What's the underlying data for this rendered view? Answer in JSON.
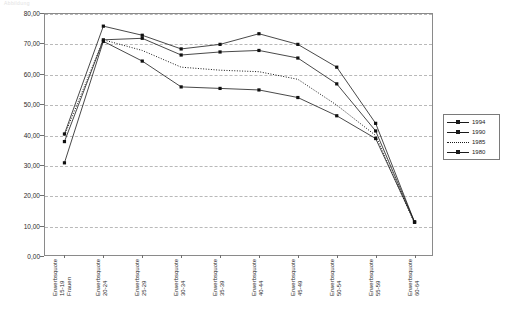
{
  "faint_header": "Abbildung",
  "chart_data": {
    "type": "line",
    "title": "",
    "subtitle": "",
    "xlabel": "",
    "ylabel": "",
    "ylim": [
      0,
      80
    ],
    "ytick_step": 10,
    "grid": true,
    "legend_position": "right",
    "ytick_labels": [
      "0,00",
      "10,00",
      "20,00",
      "30,00",
      "40,00",
      "50,00",
      "60,00",
      "70,00",
      "80,00"
    ],
    "categories": [
      "Erwerbsquote 15-19 Frauen",
      "Erwerbsquote 20-24",
      "Erwerbsquote 25-29",
      "Erwerbsquote 30-34",
      "Erwerbsquote 35-39",
      "Erwerbsquote 40-44",
      "Erwerbsquote 45-49",
      "Erwerbsquote 50-54",
      "Erwerbsquote 55-59",
      "Erwerbsquote 60-64"
    ],
    "category_lines": [
      [
        "Erwerbsquote",
        "15-19",
        "Frauen"
      ],
      [
        "Erwerbsquote",
        "20-24"
      ],
      [
        "Erwerbsquote",
        "25-29"
      ],
      [
        "Erwerbsquote",
        "30-34"
      ],
      [
        "Erwerbsquote",
        "35-39"
      ],
      [
        "Erwerbsquote",
        "40-44"
      ],
      [
        "Erwerbsquote",
        "45-49"
      ],
      [
        "Erwerbsquote",
        "50-54"
      ],
      [
        "Erwerbsquote",
        "55-59"
      ],
      [
        "Erwerbsquote",
        "60-64"
      ]
    ],
    "series": [
      {
        "name": "1994",
        "style": "solid",
        "marker": "square",
        "values": [
          40.5,
          76.0,
          73.0,
          68.5,
          70.0,
          73.5,
          70.0,
          62.5,
          44.0,
          11.5
        ]
      },
      {
        "name": "1990",
        "style": "solid",
        "marker": "square",
        "values": [
          38.0,
          71.5,
          72.0,
          66.5,
          67.5,
          68.0,
          65.5,
          57.0,
          41.5,
          11.5
        ]
      },
      {
        "name": "1985",
        "style": "dotted",
        "marker": "none",
        "values": [
          40.0,
          71.5,
          68.0,
          62.5,
          61.5,
          61.0,
          58.5,
          50.0,
          40.0,
          11.0
        ]
      },
      {
        "name": "1980",
        "style": "solid",
        "marker": "square",
        "values": [
          31.0,
          71.0,
          64.5,
          56.0,
          55.5,
          55.0,
          52.5,
          46.5,
          39.0,
          11.5
        ]
      }
    ]
  }
}
